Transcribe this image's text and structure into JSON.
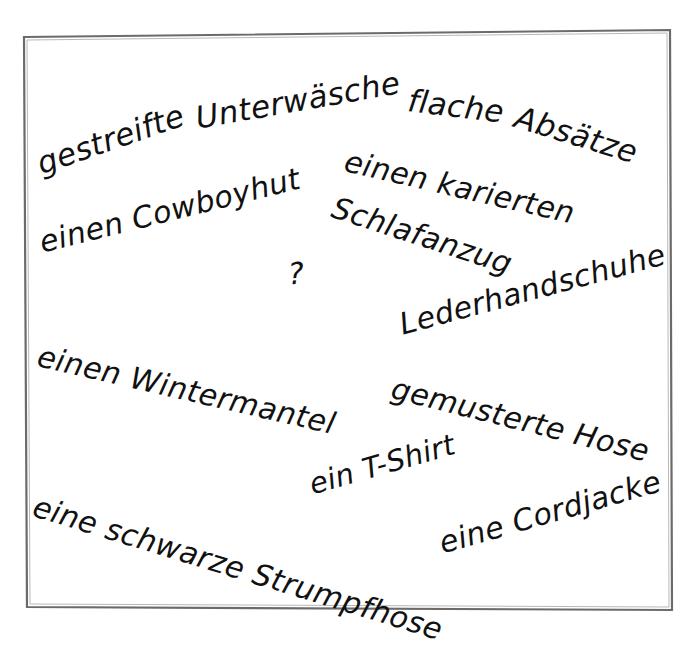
{
  "page": {
    "type": "handwriting-worksheet-scan",
    "language": "German",
    "background_color": "#ffffff",
    "ink_color": "#111111",
    "frame_border_color": "#6b6b6b"
  },
  "frame": {
    "name": "paper-border-rectangle",
    "corners": {
      "top_left": [
        24,
        37
      ],
      "top_right": [
        670,
        30
      ],
      "bottom_right": [
        672,
        610
      ],
      "bottom_left": [
        27,
        607
      ]
    }
  },
  "items": [
    {
      "id": "gestreifte",
      "text": "gestreifte"
    },
    {
      "id": "unterwaesche",
      "text": "Unterwäsche"
    },
    {
      "id": "flache",
      "text": "flache"
    },
    {
      "id": "absaetze",
      "text": "Absätze"
    },
    {
      "id": "einen_karierten",
      "text": "einen karierten"
    },
    {
      "id": "schlafanzug",
      "text": "Schlafanzug"
    },
    {
      "id": "einen_cowboyhut",
      "text": "einen Cowboyhut"
    },
    {
      "id": "lederhandschuhe",
      "text": "Lederhandschuhe"
    },
    {
      "id": "einen_wintermantel",
      "text": "einen Wintermantel"
    },
    {
      "id": "gemusterte_hose",
      "text": "gemusterte Hose"
    },
    {
      "id": "ein_tshirt",
      "text": "ein T-Shirt"
    },
    {
      "id": "schwarze_strumpfhose",
      "text": "eine schwarze Strumpfhose"
    },
    {
      "id": "eine_cordjacke",
      "text": "eine Cordjacke"
    }
  ],
  "phrases": {
    "gestreifte": "gestreifte",
    "unterwaesche": "Unterwäsche",
    "flache": "flache",
    "absaetze": "Absätze",
    "einen_karierten": "einen karierten",
    "schlafanzug": "Schlafanzug",
    "einen_cowboyhut": "einen Cowboyhut",
    "lederhandschuhe": "Lederhandschuhe",
    "einen_wintermantel": "einen Wintermantel",
    "gemusterte_hose": "gemusterte Hose",
    "ein_tshirt": "ein T-Shirt",
    "schwarze_strumpfhose": "eine schwarze Strumpfhose",
    "eine_cordjacke": "eine Cordjacke"
  },
  "center_mark": {
    "text": "?",
    "name": "question-mark"
  }
}
